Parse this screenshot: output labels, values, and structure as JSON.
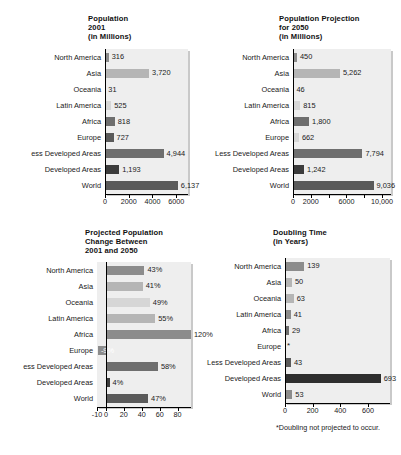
{
  "figure": {
    "categories": [
      "North America",
      "Asia",
      "Oceania",
      "Latin America",
      "Africa",
      "Europe",
      "Less Developed Areas",
      "Developed Areas",
      "World"
    ],
    "clipped_labels": {
      "left_panels_less_developed": "ess Developed Areas"
    }
  },
  "chart_data": [
    {
      "type": "bar",
      "title": "Population\n2001\n(in Millions)",
      "orientation": "horizontal",
      "xlabel": "",
      "ylabel": "",
      "grid": false,
      "legend": "none",
      "xlim": [
        0,
        7000
      ],
      "ticks": [
        0,
        2000,
        4000,
        6000
      ],
      "ticklabels": [
        "0",
        "2000",
        "4000",
        "6000"
      ],
      "categories": [
        "North America",
        "Asia",
        "Oceania",
        "Latin America",
        "Africa",
        "Europe",
        "Less Developed Areas",
        "Developed Areas",
        "World"
      ],
      "values": [
        316,
        3720,
        31,
        525,
        818,
        727,
        4944,
        1193,
        6137
      ],
      "labels": [
        "316",
        "3,720",
        "31",
        "525",
        "818",
        "727",
        "4,944",
        "1,193",
        "6,137"
      ],
      "colors": [
        "#8c8c8c",
        "#b5b5b5",
        "#b5b5b5",
        "#d6d6d6",
        "#6e6e6e",
        "#5a5a5a",
        "#6e6e6e",
        "#3c3c3c",
        "#5a5a5a"
      ]
    },
    {
      "type": "bar",
      "title": "Population Projection\nfor 2050\n(in Millions)",
      "orientation": "horizontal",
      "xlabel": "",
      "ylabel": "",
      "grid": false,
      "legend": "none",
      "xlim": [
        0,
        11000
      ],
      "ticks": [
        0,
        2000,
        4000,
        6000,
        8000,
        10000
      ],
      "ticklabels": [
        "0",
        "2000",
        "",
        "6000",
        "",
        "10,000"
      ],
      "categories": [
        "North America",
        "Asia",
        "Oceania",
        "Latin America",
        "Africa",
        "Europe",
        "Less Developed Areas",
        "Developed Areas",
        "World"
      ],
      "values": [
        450,
        5262,
        46,
        815,
        1800,
        662,
        7794,
        1242,
        9036
      ],
      "labels": [
        "450",
        "5,262",
        "46",
        "815",
        "1,800",
        "662",
        "7,794",
        "1,242",
        "9,036"
      ],
      "colors": [
        "#8c8c8c",
        "#b5b5b5",
        "#b5b5b5",
        "#d6d6d6",
        "#6e6e6e",
        "#d6d6d6",
        "#6e6e6e",
        "#3c3c3c",
        "#5a5a5a"
      ]
    },
    {
      "type": "bar",
      "title": "Projected Population\nChange Between\n2001 and 2050",
      "orientation": "horizontal",
      "xlabel": "",
      "ylabel": "",
      "grid": false,
      "legend": "none",
      "xlim": [
        -10,
        95
      ],
      "ticks": [
        -10,
        0,
        20,
        40,
        60,
        80
      ],
      "ticklabels": [
        "-10",
        "0",
        "20",
        "40",
        "60",
        "80"
      ],
      "categories": [
        "North America",
        "Asia",
        "Oceania",
        "Latin America",
        "Africa",
        "Europe",
        "Less Developed Areas",
        "Developed Areas",
        "World"
      ],
      "values": [
        43,
        41,
        49,
        55,
        120,
        -9,
        58,
        4,
        47
      ],
      "labels": [
        "43%",
        "41%",
        "49%",
        "55%",
        "120%",
        "-9%",
        "58%",
        "4%",
        "47%"
      ],
      "colors": [
        "#8c8c8c",
        "#b5b5b5",
        "#d6d6d6",
        "#b5b5b5",
        "#8c8c8c",
        "#8c8c8c",
        "#6e6e6e",
        "#3c3c3c",
        "#5a5a5a"
      ]
    },
    {
      "type": "bar",
      "title": "Doubling Time\n(in Years)",
      "orientation": "horizontal",
      "xlabel": "",
      "ylabel": "",
      "grid": false,
      "legend": "none",
      "xlim": [
        0,
        760
      ],
      "ticks": [
        0,
        200,
        400,
        600
      ],
      "ticklabels": [
        "0",
        "200",
        "400",
        "600"
      ],
      "categories": [
        "North America",
        "Asia",
        "Oceania",
        "Latin America",
        "Africa",
        "Europe",
        "Less Developed Areas",
        "Developed Areas",
        "World"
      ],
      "values": [
        139,
        50,
        63,
        41,
        29,
        null,
        43,
        693,
        53
      ],
      "labels": [
        "139",
        "50",
        "63",
        "41",
        "29",
        "*",
        "43",
        "693",
        "53"
      ],
      "colors": [
        "#8c8c8c",
        "#b5b5b5",
        "#b5b5b5",
        "#8c8c8c",
        "#6e6e6e",
        "#000000",
        "#5a5a5a",
        "#2e2e2e",
        "#8c8c8c"
      ],
      "footnote": "*Doubling not projected to occur.",
      "footnote_star": "*"
    }
  ]
}
